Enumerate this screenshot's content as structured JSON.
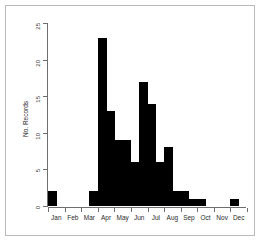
{
  "chart_data": {
    "type": "bar",
    "title": "",
    "subtitle": "",
    "xlabel": "",
    "ylabel": "No. Records",
    "ylim": [
      0,
      25
    ],
    "yticks": [
      0,
      5,
      10,
      15,
      20,
      25
    ],
    "ytick_labels": [
      "0",
      "5",
      "10",
      "15",
      "20",
      "25"
    ],
    "grid": false,
    "legend": null,
    "bar_color": "#000000",
    "axis_color": "#6e6e6e",
    "frame_color": "#b9b9b9",
    "background": "#ffffff",
    "xtick_labels": [
      "Jan",
      "Feb",
      "Mar",
      "Apr",
      "May",
      "Jun",
      "Jul",
      "Aug",
      "Sep",
      "Oct",
      "Nov",
      "Dec"
    ],
    "note": "histogram binned by half-month; 24 bins across the year",
    "categories": [
      "Jan a",
      "Jan b",
      "Feb a",
      "Feb b",
      "Mar a",
      "Mar b",
      "Apr a",
      "Apr b",
      "May a",
      "May b",
      "Jun a",
      "Jun b",
      "Jul a",
      "Jul b",
      "Aug a",
      "Aug b",
      "Sep a",
      "Sep b",
      "Oct a",
      "Oct b",
      "Nov a",
      "Nov b",
      "Dec a",
      "Dec b"
    ],
    "values": [
      2,
      0,
      0,
      0,
      0,
      2,
      23,
      13,
      9,
      9,
      6,
      17,
      14,
      6,
      8,
      2,
      2,
      1,
      1,
      0,
      0,
      0,
      1,
      0
    ]
  },
  "axes": {
    "y_label": "No. Records"
  }
}
